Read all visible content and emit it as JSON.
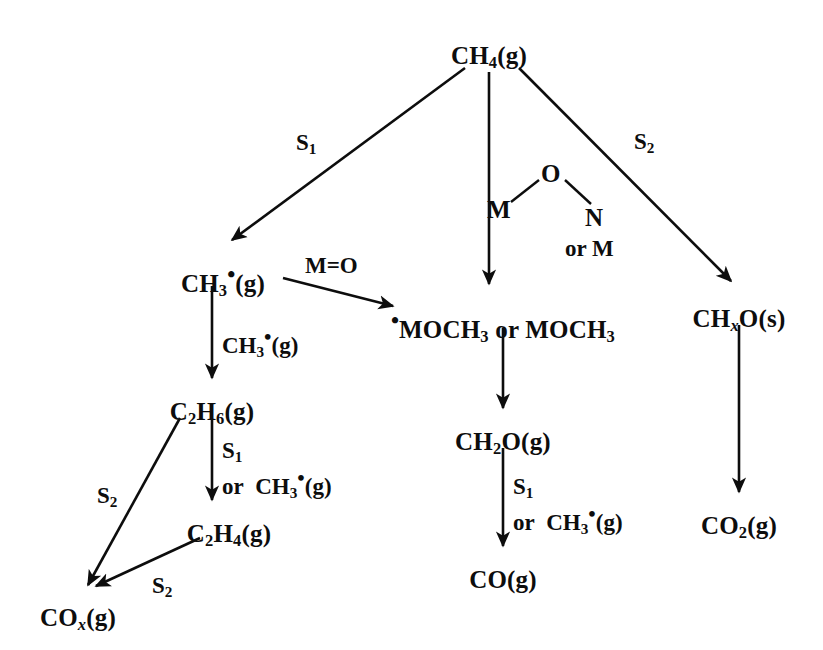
{
  "diagram": {
    "stroke_color": "#0d0d0d",
    "background_color": "#ffffff",
    "nodes": [
      {
        "id": "ch4",
        "label": "CH4(g)",
        "html": "CH<sub>4</sub>(g)",
        "x": 489,
        "y": 42
      },
      {
        "id": "ch3",
        "label": "CH3·(g)",
        "html": "CH<sub>3</sub><sup class=\"rad\">•</sup>(g)",
        "x": 223,
        "y": 262
      },
      {
        "id": "mochs",
        "label": "·MOCH3 or MOCH3",
        "html": "<sup class=\"rad\">•</sup>MOCH<sub>3</sub> or MOCH<sub>3</sub>",
        "x": 503,
        "y": 308
      },
      {
        "id": "chxo",
        "label": "CHxO(s)",
        "html": "CH<sub class=\"ital\">x</sub>O(s)",
        "x": 739,
        "y": 305
      },
      {
        "id": "c2h6",
        "label": "C2H6(g)",
        "html": "C<sub>2</sub>H<sub>6</sub>(g)",
        "x": 212,
        "y": 398
      },
      {
        "id": "ch2o",
        "label": "CH2O(g)",
        "html": "CH<sub>2</sub>O(g)",
        "x": 503,
        "y": 428
      },
      {
        "id": "c2h4",
        "label": "C2H4(g)",
        "html": "C<sub>2</sub>H<sub>4</sub>(g)",
        "x": 229,
        "y": 520
      },
      {
        "id": "co2",
        "label": "CO2(g)",
        "html": "CO<sub>2</sub>(g)",
        "x": 739,
        "y": 512
      },
      {
        "id": "co",
        "label": "CO(g)",
        "html": "CO(g)",
        "x": 503,
        "y": 566
      },
      {
        "id": "cox",
        "label": "COx(g)",
        "html": "CO<sub class=\"ital\">x</sub>(g)",
        "x": 78,
        "y": 604
      }
    ],
    "edge_labels": [
      {
        "id": "s1-top",
        "label": "S1",
        "html": "S<sub>1</sub>",
        "x": 296,
        "y": 130,
        "align": "left"
      },
      {
        "id": "s2-top",
        "label": "S2",
        "html": "S<sub>2</sub>",
        "x": 634,
        "y": 129,
        "align": "left"
      },
      {
        "id": "m-o",
        "label": "M=O",
        "html": "M=O",
        "x": 305,
        "y": 253,
        "align": "left"
      },
      {
        "id": "ch3-rad",
        "label": "CH3·(g)",
        "html": "CH<sub>3</sub><sup class=\"rad\">•</sup>(g)",
        "x": 222,
        "y": 326,
        "align": "left"
      },
      {
        "id": "s1-or-ch3-left",
        "label": "S1 or CH3·(g)",
        "html": "S<sub>1</sub><br>or&nbsp;&nbsp;CH<sub>3</sub><sup class=\"rad\">•</sup>(g)",
        "x": 222,
        "y": 437,
        "align": "left"
      },
      {
        "id": "s2-left",
        "label": "S2",
        "html": "S<sub>2</sub>",
        "x": 97,
        "y": 483,
        "align": "left"
      },
      {
        "id": "s2-bottom",
        "label": "S2",
        "html": "S<sub>2</sub>",
        "x": 152,
        "y": 573,
        "align": "left"
      },
      {
        "id": "s1-or-ch3-mid",
        "label": "S1 or CH3·(g)",
        "html": "S<sub>1</sub><br>or&nbsp;&nbsp;CH<sub>3</sub><sup class=\"rad\">•</sup>(g)",
        "x": 513,
        "y": 473,
        "align": "left"
      }
    ],
    "mon_label": {
      "id": "m-o-n",
      "label": "M-O-N or M",
      "atoms": [
        {
          "text": "M",
          "x": 0,
          "y": 44
        },
        {
          "text": "O",
          "x": 54,
          "y": 8
        },
        {
          "text": "N",
          "x": 98,
          "y": 52
        }
      ],
      "or_m": "or M",
      "x": 487,
      "y": 152
    },
    "arrows": [
      {
        "id": "ch4-to-ch3",
        "from": "ch4",
        "to": "ch3",
        "x1": 465,
        "y1": 68,
        "x2": 232,
        "y2": 240
      },
      {
        "id": "ch4-to-mochs",
        "from": "ch4",
        "to": "mochs",
        "x1": 489,
        "y1": 72,
        "x2": 489,
        "y2": 284
      },
      {
        "id": "ch4-to-chxo",
        "from": "ch4",
        "to": "chxo",
        "x1": 519,
        "y1": 68,
        "x2": 731,
        "y2": 281
      },
      {
        "id": "ch3-to-mochs",
        "from": "ch3",
        "to": "mochs",
        "x1": 283,
        "y1": 278,
        "x2": 393,
        "y2": 306
      },
      {
        "id": "ch3-to-c2h6",
        "from": "ch3",
        "to": "c2h6",
        "x1": 212,
        "y1": 286,
        "x2": 212,
        "y2": 378
      },
      {
        "id": "c2h6-to-cox",
        "from": "c2h6",
        "to": "cox",
        "x1": 180,
        "y1": 418,
        "x2": 88,
        "y2": 585
      },
      {
        "id": "c2h6-to-c2h4",
        "from": "c2h6",
        "to": "c2h4",
        "x1": 212,
        "y1": 420,
        "x2": 212,
        "y2": 500
      },
      {
        "id": "c2h4-to-cox",
        "from": "c2h4",
        "to": "cox",
        "x1": 200,
        "y1": 538,
        "x2": 96,
        "y2": 586
      },
      {
        "id": "mochs-to-ch2o",
        "from": "mochs",
        "to": "ch2o",
        "x1": 503,
        "y1": 328,
        "x2": 503,
        "y2": 408
      },
      {
        "id": "ch2o-to-co",
        "from": "ch2o",
        "to": "co",
        "x1": 503,
        "y1": 448,
        "x2": 503,
        "y2": 546
      },
      {
        "id": "chxo-to-co2",
        "from": "chxo",
        "to": "co2",
        "x1": 739,
        "y1": 325,
        "x2": 739,
        "y2": 492
      }
    ]
  }
}
